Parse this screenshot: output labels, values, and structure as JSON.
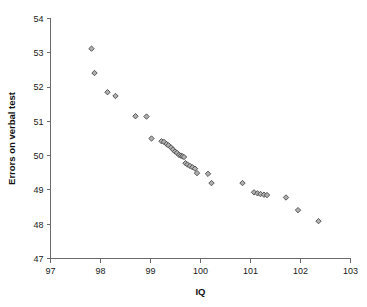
{
  "chart_data": {
    "type": "scatter",
    "title": "",
    "xlabel": "IQ",
    "ylabel": "Errors on verbal test",
    "xlim": [
      97,
      103
    ],
    "ylim": [
      47,
      54
    ],
    "xticks": [
      97,
      98,
      99,
      100,
      101,
      102,
      103
    ],
    "yticks": [
      47,
      48,
      49,
      50,
      51,
      52,
      53,
      54
    ],
    "grid": false,
    "legend": null,
    "marker": "diamond",
    "marker_fill": "#b0b0b0",
    "marker_edge": "#4a4a4a",
    "series": [
      {
        "name": "observations",
        "points": [
          [
            97.82,
            53.12
          ],
          [
            97.88,
            52.41
          ],
          [
            98.14,
            51.85
          ],
          [
            98.3,
            51.74
          ],
          [
            98.7,
            51.15
          ],
          [
            98.92,
            51.14
          ],
          [
            99.02,
            50.5
          ],
          [
            99.22,
            50.42
          ],
          [
            99.27,
            50.4
          ],
          [
            99.32,
            50.34
          ],
          [
            99.36,
            50.3
          ],
          [
            99.41,
            50.24
          ],
          [
            99.45,
            50.18
          ],
          [
            99.49,
            50.12
          ],
          [
            99.53,
            50.08
          ],
          [
            99.57,
            50.02
          ],
          [
            99.61,
            50.0
          ],
          [
            99.64,
            49.98
          ],
          [
            99.67,
            49.96
          ],
          [
            99.7,
            49.78
          ],
          [
            99.74,
            49.74
          ],
          [
            99.79,
            49.7
          ],
          [
            99.84,
            49.66
          ],
          [
            99.89,
            49.62
          ],
          [
            99.93,
            49.49
          ],
          [
            100.15,
            49.47
          ],
          [
            100.22,
            49.2
          ],
          [
            100.84,
            49.2
          ],
          [
            101.07,
            48.93
          ],
          [
            101.14,
            48.9
          ],
          [
            101.2,
            48.88
          ],
          [
            101.27,
            48.86
          ],
          [
            101.33,
            48.85
          ],
          [
            101.71,
            48.78
          ],
          [
            101.95,
            48.41
          ],
          [
            102.36,
            48.09
          ]
        ]
      }
    ]
  },
  "axes": {
    "x_tick_labels": [
      "97",
      "98",
      "99",
      "100",
      "101",
      "102",
      "103"
    ],
    "y_tick_labels": [
      "47",
      "48",
      "49",
      "50",
      "51",
      "52",
      "53",
      "54"
    ],
    "x_title": "IQ",
    "y_title": "Errors on verbal test"
  },
  "colors": {
    "axis": "#6b6b6b",
    "text": "#1a1a1a",
    "marker_fill": "#b0b0b0",
    "marker_edge": "#4a4a4a",
    "background": "#ffffff"
  }
}
